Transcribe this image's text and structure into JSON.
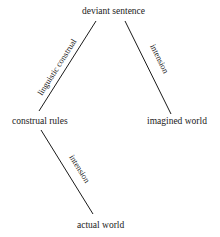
{
  "diagram": {
    "nodes": {
      "deviant_sentence": "deviant sentence",
      "construal_rules": "construal  rules",
      "imagined_world": "imagined world",
      "actual_world": "actual world"
    },
    "edges": [
      {
        "from": "deviant sentence",
        "to": "construal rules",
        "label": "linguistic construal"
      },
      {
        "from": "deviant sentence",
        "to": "imagined world",
        "label": "intension"
      },
      {
        "from": "construal rules",
        "to": "actual world",
        "label": "intension"
      }
    ]
  }
}
